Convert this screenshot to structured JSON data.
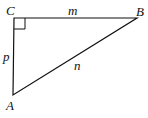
{
  "diagram": {
    "type": "right-triangle",
    "vertices": {
      "C": {
        "label": "C",
        "x": 14,
        "y": 18
      },
      "B": {
        "label": "B",
        "x": 137,
        "y": 18
      },
      "A": {
        "label": "A",
        "x": 13,
        "y": 95
      }
    },
    "sides": {
      "CB": {
        "label": "m"
      },
      "CA": {
        "label": "p"
      },
      "AB": {
        "label": "n"
      }
    },
    "right_angle_at": "C",
    "stroke_color": "#111111"
  }
}
